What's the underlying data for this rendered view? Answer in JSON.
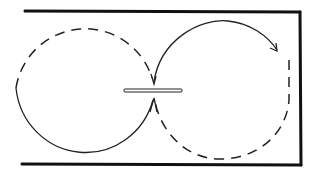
{
  "diagram": {
    "type": "figure-eight path through slit",
    "elements": {
      "frame": {
        "sides": [
          "top",
          "right",
          "bottom"
        ],
        "open_side": "left",
        "color": "#111111"
      },
      "left_loop": {
        "solid_segment": "bottom/left-lower",
        "dashed_segment": "top/left-upper"
      },
      "right_loop": {
        "solid_segment": "top with arrow",
        "dashed_segment": "right/bottom",
        "arrow_direction": "clockwise"
      },
      "center_slit": {
        "orientation": "horizontal"
      }
    },
    "labels": []
  }
}
